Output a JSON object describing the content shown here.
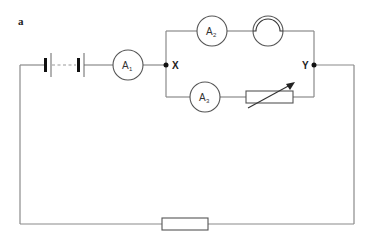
{
  "figure": {
    "panel_label": "a"
  },
  "components": {
    "battery": {
      "type": "battery",
      "cells": 2,
      "dashed_link": true
    },
    "ammeter_1": {
      "type": "ammeter",
      "label": "A",
      "subscript": "1"
    },
    "ammeter_2": {
      "type": "ammeter",
      "label": "A",
      "subscript": "2"
    },
    "ammeter_3": {
      "type": "ammeter",
      "label": "A",
      "subscript": "3"
    },
    "lamp": {
      "type": "filament-lamp"
    },
    "variable_resistor": {
      "type": "variable-resistor"
    },
    "resistor": {
      "type": "fixed-resistor"
    }
  },
  "junctions": {
    "x": {
      "label": "X"
    },
    "y": {
      "label": "Y"
    }
  },
  "colors": {
    "wire": "#8a8a8a",
    "component_stroke": "#555555",
    "text": "#222222",
    "background": "#ffffff"
  }
}
